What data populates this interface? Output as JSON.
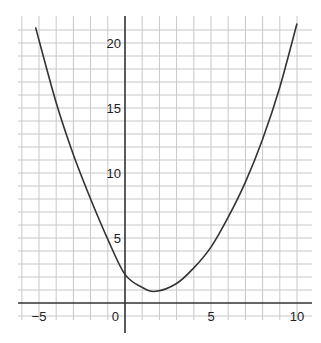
{
  "chart_data": {
    "type": "line",
    "title": "",
    "xlabel": "",
    "ylabel": "",
    "xlim": [
      -6,
      10.5
    ],
    "ylim": [
      -1.5,
      22
    ],
    "grid": true,
    "x_ticks": [
      -5,
      0,
      5,
      10
    ],
    "y_ticks": [
      5,
      10,
      15,
      20
    ],
    "x_tick_labels": [
      "−5",
      "0",
      "5",
      "10"
    ],
    "y_tick_labels": [
      "5",
      "10",
      "15",
      "20"
    ],
    "series": [
      {
        "name": "curve",
        "color": "#333333",
        "x": [
          -5.2,
          -4,
          -3,
          -2,
          -1,
          0,
          1,
          1.8,
          3,
          4,
          5,
          6,
          7,
          8,
          9,
          10
        ],
        "y": [
          21.2,
          15.4,
          11.4,
          8.0,
          4.9,
          2.2,
          1.2,
          0.9,
          1.5,
          2.7,
          4.3,
          6.6,
          9.3,
          12.6,
          16.6,
          21.5
        ]
      }
    ]
  },
  "axes": {
    "x_labels": [
      "−5",
      "0",
      "5",
      "10"
    ],
    "y_labels": [
      "5",
      "10",
      "15",
      "20"
    ]
  }
}
